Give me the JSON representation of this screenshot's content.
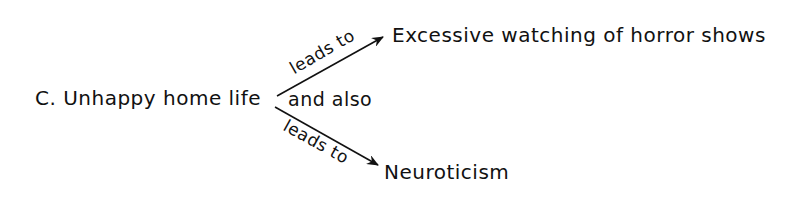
{
  "diagram": {
    "source": "C. Unhappy home life",
    "connector": "and also",
    "edges": [
      {
        "label": "leads to",
        "target": "Excessive watching of horror shows"
      },
      {
        "label": "leads to",
        "target": "Neuroticism"
      }
    ]
  }
}
